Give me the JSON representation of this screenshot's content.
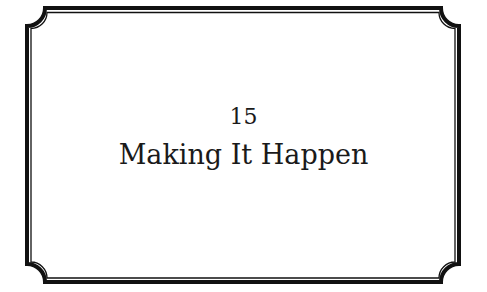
{
  "page": {
    "chapter_number": "15",
    "chapter_title": "Making It Happen"
  },
  "colors": {
    "background": "#ffffff",
    "border": "#111111",
    "text": "#1a1a1a"
  }
}
